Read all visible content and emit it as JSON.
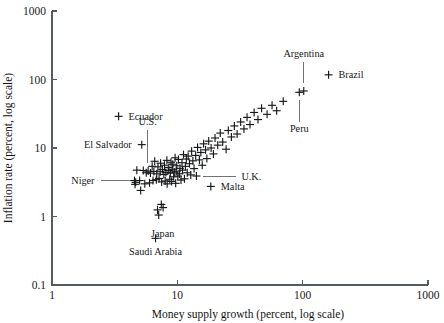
{
  "chart_data": {
    "type": "scatter",
    "title": "",
    "xlabel": "Money supply growth (percent, log scale)",
    "ylabel": "Inflation rate (percent, log scale)",
    "xscale": "log",
    "yscale": "log",
    "xlim": [
      1,
      1000
    ],
    "ylim": [
      0.1,
      1000
    ],
    "xticks": [
      "1",
      "10",
      "100",
      "1000"
    ],
    "xtick_values": [
      1,
      10,
      100,
      1000
    ],
    "yticks": [
      "1000",
      "100",
      "10",
      "1",
      "0.1"
    ],
    "ytick_values": [
      1000,
      100,
      10,
      1,
      0.1
    ],
    "grid": false,
    "legend": "none",
    "marker": "plus",
    "marker_color": "#16181a",
    "axis_color": "#555b5e",
    "background": "#ffffff",
    "annotations": [
      {
        "label": "Ecuador",
        "x": 3.4,
        "y": 29.0,
        "anchor": "start",
        "label_dx": 10,
        "label_dy": 3.5,
        "leader": false
      },
      {
        "label": "El Salvador",
        "x": 5.2,
        "y": 11.2,
        "anchor": "end",
        "label_dx": -10,
        "label_dy": 3.5,
        "leader": false
      },
      {
        "label": "U.S.",
        "x": 5.8,
        "y": 4.6,
        "anchor": "mid",
        "label_dx": 0,
        "label_dy": -46,
        "leader": true,
        "leader_type": "vertical"
      },
      {
        "label": "Niger",
        "x": 4.9,
        "y": 3.3,
        "anchor": "end",
        "label_dx": -44,
        "label_dy": 3.5,
        "leader": true,
        "leader_type": "horizontal"
      },
      {
        "label": "Japan",
        "x": 7.1,
        "y": 1.05,
        "anchor": "mid",
        "label_dx": 4,
        "label_dy": 22,
        "leader": false
      },
      {
        "label": "Saudi Arabia",
        "x": 6.7,
        "y": 0.48,
        "anchor": "mid",
        "label_dx": 0,
        "label_dy": 17,
        "leader": false
      },
      {
        "label": "U.K.",
        "x": 14.2,
        "y": 3.9,
        "anchor": "start",
        "label_dx": 45,
        "label_dy": 3.5,
        "leader": true,
        "leader_type": "horizontal"
      },
      {
        "label": "Malta",
        "x": 18.5,
        "y": 2.75,
        "anchor": "start",
        "label_dx": 10,
        "label_dy": 3.5,
        "leader": false
      },
      {
        "label": "Peru",
        "x": 94.0,
        "y": 65.0,
        "anchor": "mid",
        "label_dx": 0,
        "label_dy": 40,
        "leader": true,
        "leader_type": "vertical"
      },
      {
        "label": "Argentina",
        "x": 102.0,
        "y": 68.0,
        "anchor": "mid",
        "label_dx": 0,
        "label_dy": -34,
        "leader": true,
        "leader_type": "vertical"
      },
      {
        "label": "Brazil",
        "x": 161.0,
        "y": 117.0,
        "anchor": "start",
        "label_dx": 10,
        "label_dy": 3.5,
        "leader": false
      }
    ],
    "points": [
      {
        "x": 3.4,
        "y": 29.0
      },
      {
        "x": 5.2,
        "y": 11.2
      },
      {
        "x": 4.75,
        "y": 4.75
      },
      {
        "x": 4.55,
        "y": 3.35
      },
      {
        "x": 4.6,
        "y": 2.95
      },
      {
        "x": 4.65,
        "y": 3.15
      },
      {
        "x": 5.0,
        "y": 3.35
      },
      {
        "x": 5.1,
        "y": 2.4
      },
      {
        "x": 5.35,
        "y": 4.7
      },
      {
        "x": 5.5,
        "y": 3.0
      },
      {
        "x": 5.65,
        "y": 4.35
      },
      {
        "x": 5.85,
        "y": 4.6
      },
      {
        "x": 6.0,
        "y": 3.1
      },
      {
        "x": 6.1,
        "y": 4.3
      },
      {
        "x": 6.3,
        "y": 5.4
      },
      {
        "x": 6.4,
        "y": 3.35
      },
      {
        "x": 6.5,
        "y": 4.55
      },
      {
        "x": 6.6,
        "y": 6.4
      },
      {
        "x": 6.7,
        "y": 0.48
      },
      {
        "x": 6.8,
        "y": 3.45
      },
      {
        "x": 6.85,
        "y": 4.2
      },
      {
        "x": 6.95,
        "y": 1.25
      },
      {
        "x": 7.0,
        "y": 5.3
      },
      {
        "x": 7.1,
        "y": 1.05
      },
      {
        "x": 7.15,
        "y": 3.6
      },
      {
        "x": 7.3,
        "y": 4.5
      },
      {
        "x": 7.35,
        "y": 6.0
      },
      {
        "x": 7.45,
        "y": 1.5
      },
      {
        "x": 7.5,
        "y": 3.2
      },
      {
        "x": 7.6,
        "y": 4.85
      },
      {
        "x": 7.7,
        "y": 1.35
      },
      {
        "x": 7.8,
        "y": 4.1
      },
      {
        "x": 7.9,
        "y": 5.6
      },
      {
        "x": 8.0,
        "y": 3.3
      },
      {
        "x": 8.1,
        "y": 4.4
      },
      {
        "x": 8.25,
        "y": 6.6
      },
      {
        "x": 8.3,
        "y": 3.0
      },
      {
        "x": 8.45,
        "y": 4.7
      },
      {
        "x": 8.55,
        "y": 5.2
      },
      {
        "x": 8.7,
        "y": 3.5
      },
      {
        "x": 8.8,
        "y": 4.3
      },
      {
        "x": 8.9,
        "y": 6.2
      },
      {
        "x": 9.0,
        "y": 3.25
      },
      {
        "x": 9.1,
        "y": 4.9
      },
      {
        "x": 9.2,
        "y": 5.8
      },
      {
        "x": 9.35,
        "y": 3.8
      },
      {
        "x": 9.45,
        "y": 4.45
      },
      {
        "x": 9.6,
        "y": 7.2
      },
      {
        "x": 9.7,
        "y": 3.05
      },
      {
        "x": 9.8,
        "y": 4.6
      },
      {
        "x": 9.9,
        "y": 5.5
      },
      {
        "x": 10.1,
        "y": 3.9
      },
      {
        "x": 10.2,
        "y": 6.8
      },
      {
        "x": 10.4,
        "y": 4.2
      },
      {
        "x": 10.5,
        "y": 5.05
      },
      {
        "x": 10.7,
        "y": 3.4
      },
      {
        "x": 10.9,
        "y": 6.1
      },
      {
        "x": 11.0,
        "y": 4.75
      },
      {
        "x": 11.2,
        "y": 8.0
      },
      {
        "x": 11.4,
        "y": 3.55
      },
      {
        "x": 11.6,
        "y": 5.4
      },
      {
        "x": 11.8,
        "y": 6.9
      },
      {
        "x": 12.0,
        "y": 4.35
      },
      {
        "x": 12.2,
        "y": 7.6
      },
      {
        "x": 12.5,
        "y": 5.9
      },
      {
        "x": 12.8,
        "y": 4.05
      },
      {
        "x": 13.0,
        "y": 9.0
      },
      {
        "x": 13.3,
        "y": 6.5
      },
      {
        "x": 13.6,
        "y": 5.0
      },
      {
        "x": 14.0,
        "y": 7.8
      },
      {
        "x": 14.2,
        "y": 3.9
      },
      {
        "x": 14.5,
        "y": 10.2
      },
      {
        "x": 15.0,
        "y": 6.7
      },
      {
        "x": 15.4,
        "y": 8.6
      },
      {
        "x": 15.8,
        "y": 5.6
      },
      {
        "x": 16.2,
        "y": 11.5
      },
      {
        "x": 16.8,
        "y": 9.4
      },
      {
        "x": 17.2,
        "y": 7.0
      },
      {
        "x": 17.8,
        "y": 12.6
      },
      {
        "x": 18.5,
        "y": 2.75
      },
      {
        "x": 18.6,
        "y": 10.0
      },
      {
        "x": 19.4,
        "y": 8.2
      },
      {
        "x": 20.0,
        "y": 14.0
      },
      {
        "x": 21.0,
        "y": 11.0
      },
      {
        "x": 22.0,
        "y": 16.5
      },
      {
        "x": 23.0,
        "y": 12.2
      },
      {
        "x": 24.5,
        "y": 9.6
      },
      {
        "x": 25.5,
        "y": 18.0
      },
      {
        "x": 27.0,
        "y": 14.5
      },
      {
        "x": 28.5,
        "y": 21.0
      },
      {
        "x": 30.0,
        "y": 16.0
      },
      {
        "x": 32.0,
        "y": 24.0
      },
      {
        "x": 34.0,
        "y": 19.0
      },
      {
        "x": 36.0,
        "y": 28.0
      },
      {
        "x": 38.0,
        "y": 22.0
      },
      {
        "x": 41.0,
        "y": 33.0
      },
      {
        "x": 44.0,
        "y": 26.0
      },
      {
        "x": 47.0,
        "y": 38.0
      },
      {
        "x": 52.0,
        "y": 31.0
      },
      {
        "x": 57.0,
        "y": 42.0
      },
      {
        "x": 62.0,
        "y": 35.0
      },
      {
        "x": 70.0,
        "y": 48.0
      },
      {
        "x": 94.0,
        "y": 65.0
      },
      {
        "x": 102.0,
        "y": 68.0
      },
      {
        "x": 161.0,
        "y": 117.0
      }
    ]
  }
}
